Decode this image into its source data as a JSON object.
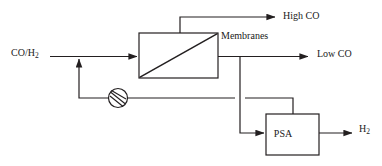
{
  "diagram": {
    "type": "process-flow-diagram",
    "line_color": "#231f20",
    "background_color": "#ffffff",
    "labels": {
      "feed": "CO/H",
      "feed_subscript": "2",
      "membranes": "Membranes",
      "high_co": "High CO",
      "low_co": "Low CO",
      "psa": "PSA",
      "hydrogen": "H",
      "hydrogen_subscript": "2"
    },
    "units": [
      {
        "name": "membrane-unit",
        "label": "Membranes",
        "shape": "rectangle-with-diagonal",
        "x": 139,
        "y": 33,
        "width": 79,
        "height": 45
      },
      {
        "name": "psa-unit",
        "label": "PSA",
        "shape": "rectangle",
        "x": 266,
        "y": 114,
        "width": 53,
        "height": 41
      },
      {
        "name": "compressor",
        "label": "",
        "shape": "circle-with-slash",
        "cx": 118,
        "cy": 98,
        "r": 9.5
      }
    ],
    "streams": [
      {
        "name": "feed-stream",
        "label": "CO/H2",
        "from": "feed-inlet",
        "to": "membrane-unit",
        "arrow": true
      },
      {
        "name": "retentate-stream",
        "label": "High CO",
        "from": "membrane-unit-top",
        "to": "high-co-outlet",
        "arrow": true
      },
      {
        "name": "permeate-stream",
        "label": "Low CO",
        "from": "membrane-unit-right",
        "to": "low-co-outlet",
        "arrow": true
      },
      {
        "name": "psa-feed-stream",
        "label": "",
        "from": "permeate-branch",
        "to": "psa-unit",
        "arrow": true
      },
      {
        "name": "psa-product-stream",
        "label": "H2",
        "from": "psa-unit",
        "to": "hydrogen-outlet",
        "arrow": true
      },
      {
        "name": "recycle-stream",
        "label": "",
        "from": "psa-unit-top",
        "to": "feed-stream",
        "arrow": true,
        "crosses": "psa-feed-stream"
      }
    ]
  }
}
